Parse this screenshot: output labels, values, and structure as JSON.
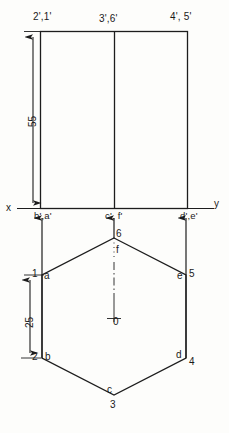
{
  "drawing": {
    "title": "Orthographic projection of hexagonal prism",
    "line_color": "#1d1d1d",
    "background_color": "#fdfdfb",
    "axis_labels": {
      "x": "x",
      "y": "y"
    },
    "dimensions": [
      {
        "id": "height-55",
        "value": "55",
        "unit": ""
      },
      {
        "id": "height-25",
        "value": "25",
        "unit": ""
      }
    ],
    "front_view": {
      "name": "front-view-rectangle",
      "corner_labels": {
        "top_left": "2',1'",
        "top_middle": "3',6'",
        "top_right": "4', 5'",
        "bottom_left": "b',a'",
        "bottom_middle": "c', f'",
        "bottom_right": "d',e'"
      }
    },
    "top_view": {
      "name": "top-view-hexagon",
      "center_label": "0",
      "vertex_labels": {
        "top_number": "6",
        "top_letter": "f",
        "left_upper_number": "1",
        "left_upper_letter": "a",
        "right_upper_letter": "e",
        "right_upper_number": "5",
        "left_lower_number": "2",
        "left_lower_letter": "b",
        "right_lower_letter": "d",
        "right_lower_number": "4",
        "bottom_letter": "c",
        "bottom_number": "3"
      }
    }
  }
}
